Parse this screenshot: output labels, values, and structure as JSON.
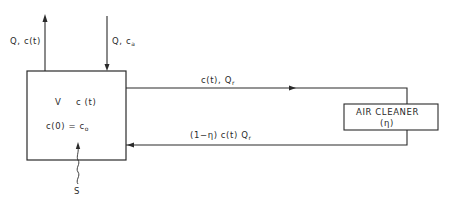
{
  "room": {
    "volume_label": "V",
    "concentration_label": "c (t)",
    "initial_condition": "c(0) = c",
    "initial_condition_sub": "o",
    "source_label": "S"
  },
  "flows": {
    "outflow_label": "Q, c(t)",
    "inflow_label": "Q, c",
    "inflow_sub": "a",
    "recirc_out_label": "c(t), Q",
    "recirc_out_sub": "r",
    "recirc_return_label": "(1−η) c(t) Q",
    "recirc_return_sub": "r"
  },
  "air_cleaner": {
    "title": "AIR CLEANER",
    "efficiency": "(η)"
  },
  "colors": {
    "line": "#2a2a2a",
    "background": "#ffffff"
  }
}
